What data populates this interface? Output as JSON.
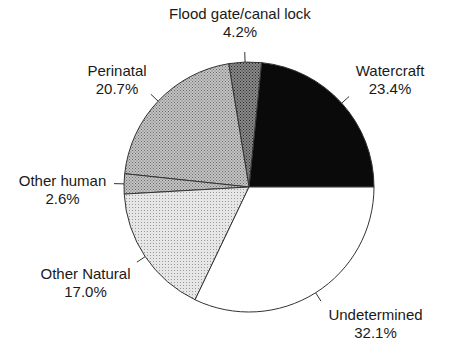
{
  "chart_data": {
    "type": "pie",
    "title": "",
    "start_angle_deg": 0,
    "direction": "counterclockwise",
    "categories": [
      "Watercraft",
      "Flood gate/canal lock",
      "Perinatal",
      "Other human",
      "Other Natural",
      "Undetermined"
    ],
    "values": [
      23.4,
      4.2,
      20.7,
      2.6,
      17.0,
      32.1
    ],
    "value_labels": [
      "23.4%",
      "4.2%",
      "20.7%",
      "2.6%",
      "17.0%",
      "32.1%"
    ],
    "fills": [
      "solid-black",
      "dense-dark-dots",
      "medium-dots",
      "medium-dots",
      "light-dots",
      "white"
    ],
    "legend": "none (direct labels)"
  },
  "labels": {
    "watercraft": {
      "name": "Watercraft",
      "pct": "23.4%"
    },
    "flood": {
      "name": "Flood gate/canal lock",
      "pct": "4.2%"
    },
    "perinatal": {
      "name": "Perinatal",
      "pct": "20.7%"
    },
    "other_human": {
      "name": "Other human",
      "pct": "2.6%"
    },
    "other_natural": {
      "name": "Other Natural",
      "pct": "17.0%"
    },
    "undetermined": {
      "name": "Undetermined",
      "pct": "32.1%"
    }
  }
}
